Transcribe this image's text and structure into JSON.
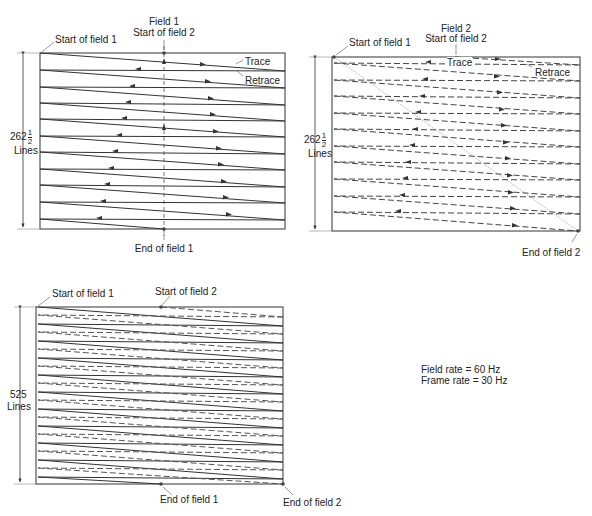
{
  "panels": {
    "field1": {
      "title_line1": "Field 1",
      "title_line2": "Start of field 2",
      "start_label": "Start of field 1",
      "end_label": "End of field 1",
      "trace_label": "Trace",
      "retrace_label": "Retrace",
      "lines_whole": "262",
      "lines_frac_num": "1",
      "lines_frac_den": "2",
      "lines_unit": "Lines"
    },
    "field2": {
      "title_line1": "Field 2",
      "title_line2": "Start of field 2",
      "start_label": "Start of field 1",
      "end_label": "End of field 2",
      "trace_label": "Trace",
      "retrace_label": "Retrace",
      "lines_whole": "262",
      "lines_frac_num": "1",
      "lines_frac_den": "2",
      "lines_unit": "Lines"
    },
    "frame": {
      "start1_label": "Start of field 1",
      "start2_label": "Start of field 2",
      "end1_label": "End of field 1",
      "end2_label": "End of field 2",
      "lines_count": "525",
      "lines_unit": "Lines"
    }
  },
  "rates": {
    "field_rate": "Field rate = 60 Hz",
    "frame_rate": "Frame rate = 30 Hz"
  },
  "colors": {
    "line": "#333333",
    "dash": "#555555",
    "guide": "#888888"
  }
}
